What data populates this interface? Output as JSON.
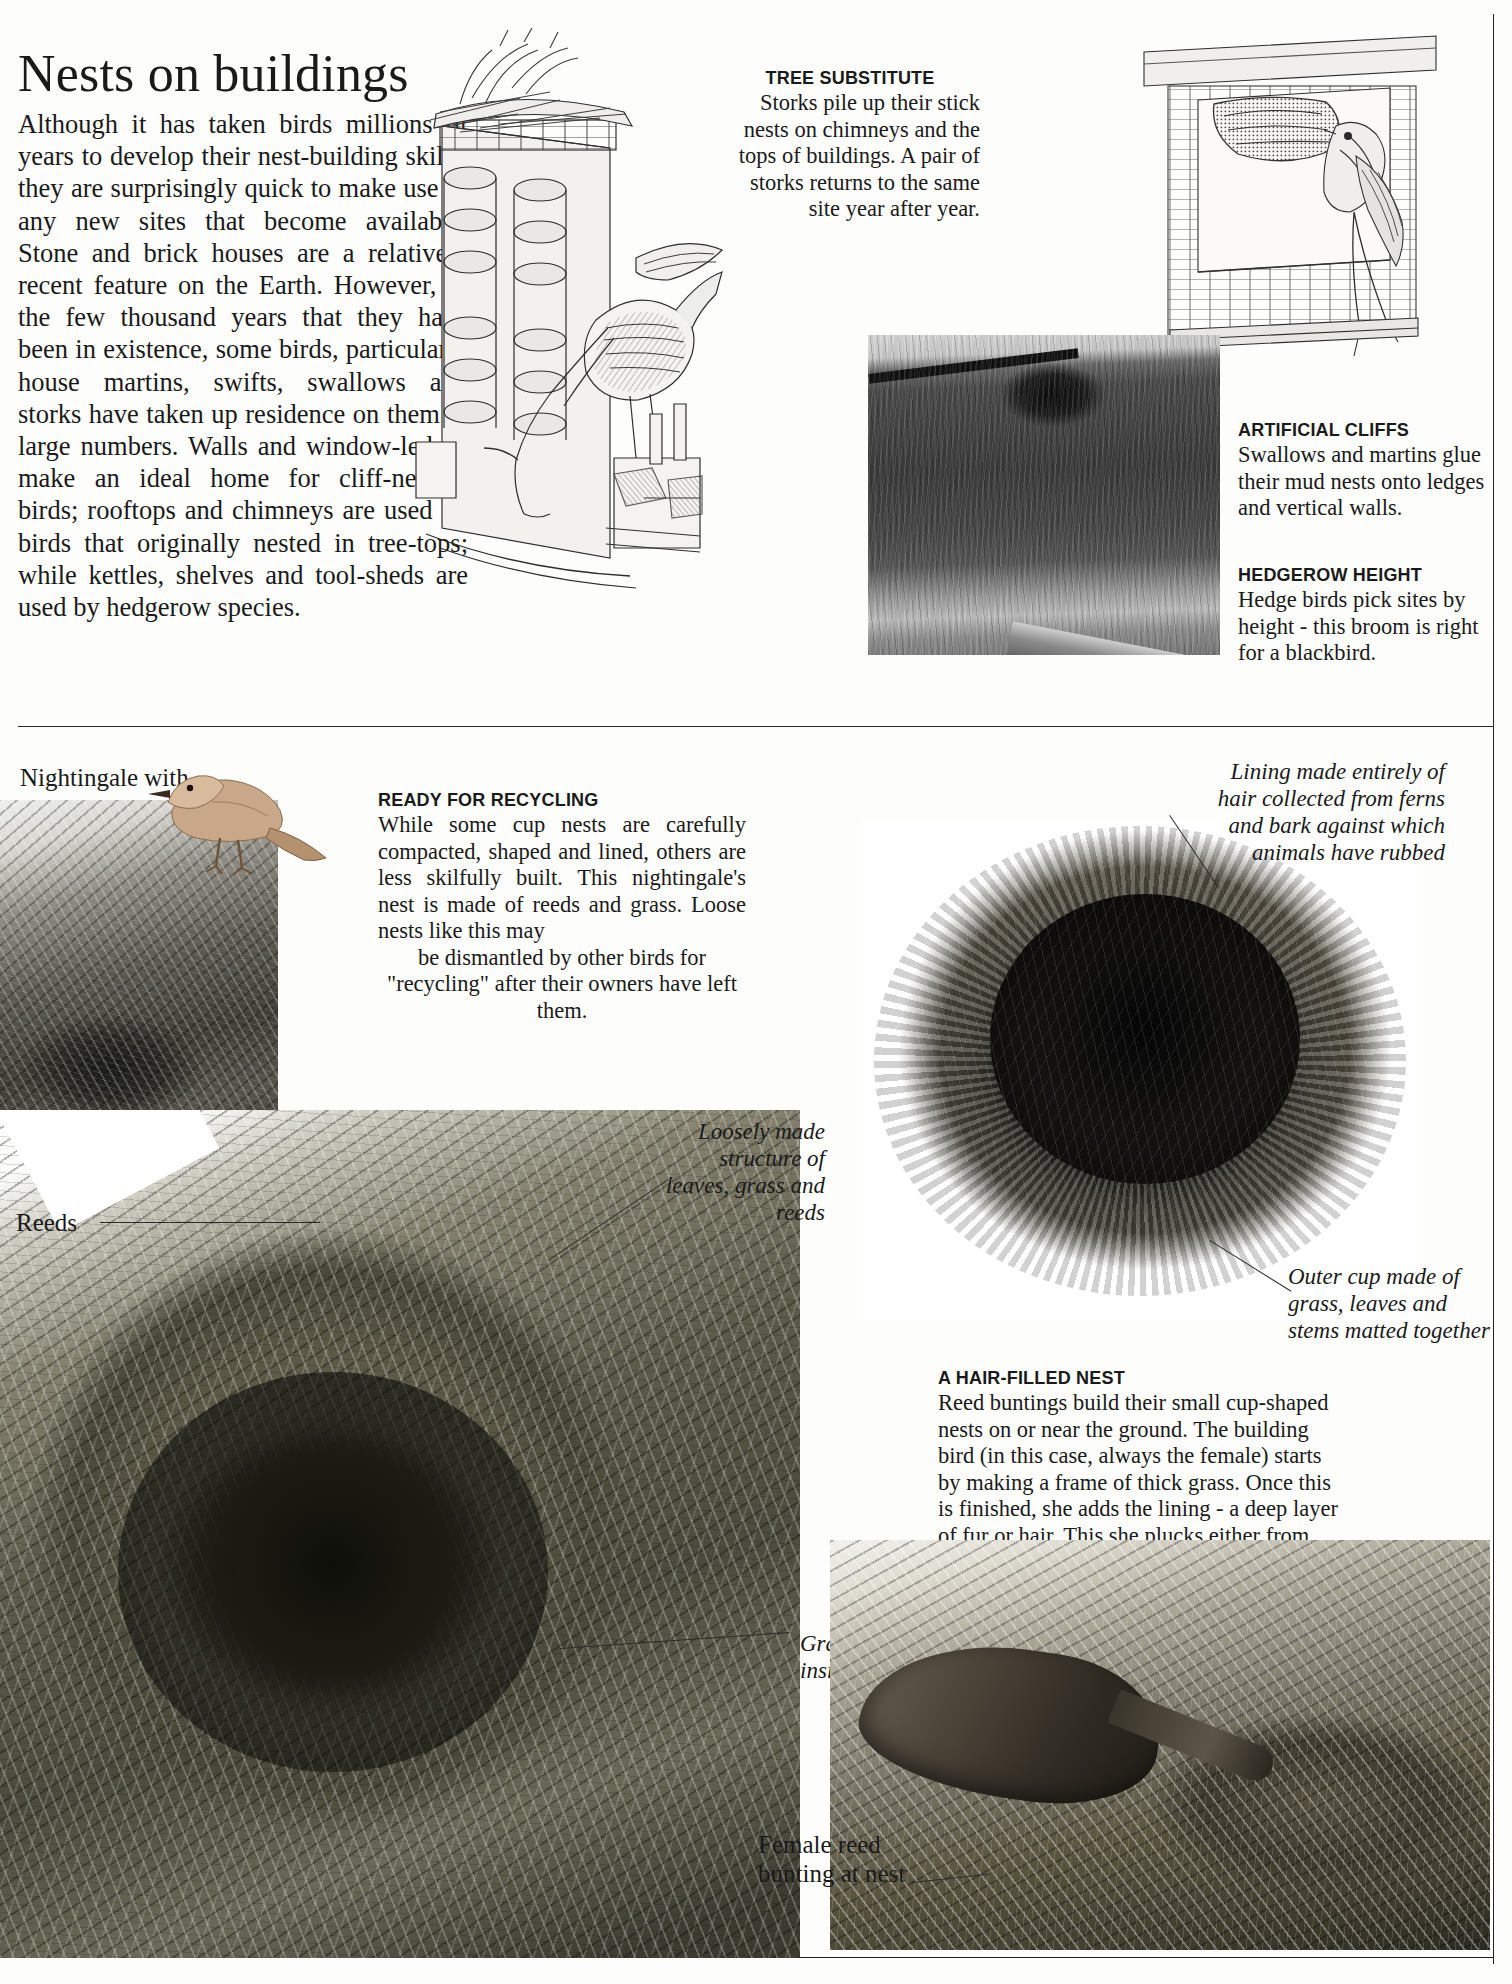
{
  "page": {
    "title": "Nests on buildings",
    "intro": "Although it has taken birds millions of years to develop their nest-building skills, they are surprisingly quick to make use of any new sites that become available. Stone and brick houses are a relatively recent feature on the Earth. However, in the few thousand years that they have been in existence, some birds, particularly house martins, swifts, swallows and storks have taken up residence on them in large numbers. Walls and window-ledges make an ideal home for cliff-nesting birds; rooftops and chimneys are used by birds that originally nested in tree-tops; while kettles, shelves and tool-sheds are used by hedgerow species."
  },
  "captions": {
    "tree_substitute": {
      "heading": "TREE SUBSTITUTE",
      "body": "Storks pile up their stick nests on chimneys and the tops of buildings. A pair of storks returns to the same site year after year."
    },
    "artificial_cliffs": {
      "heading": "ARTIFICIAL CLIFFS",
      "body": "Swallows and martins glue their mud nests onto ledges and vertical walls."
    },
    "hedgerow_height": {
      "heading": "HEDGEROW HEIGHT",
      "body": "Hedge birds pick sites by height - this broom is right for a blackbird."
    },
    "ready_for_recycling": {
      "heading": "READY FOR RECYCLING",
      "body": "While some cup nests are carefully compacted, shaped and lined, others are less skilfully built. This nightingale's nest is made of reeds and grass. Loose nests like this may",
      "body_tail": "be dismantled by other birds for \"recycling\" after their owners have left them."
    },
    "hair_filled_nest": {
      "heading": "A HAIR-FILLED NEST",
      "body": "Reed buntings build their small cup-shaped nests on or near the ground. The building bird (in this case, always the female) starts by making a frame of thick grass. Once this is finished, she adds the lining - a deep layer of fur or hair. This she plucks either from the thorns of hedgerow shrubs or from the barbs of barbed wire."
    }
  },
  "annotations": {
    "lining_hair": "Lining made entirely of hair collected from ferns and bark against which animals have rubbed",
    "outer_cup": "Outer cup made of grass, leaves and stems matted together",
    "loosely_made": "Loosely made structure of leaves, grass and reeds",
    "grass_lining": "Grass lining on inside of cup"
  },
  "labels": {
    "nightingale": "Nightingale with young",
    "reeds": "Reeds",
    "female_bunting": "Female reed bunting at nest"
  },
  "figures": {
    "stork": "stork-nest-on-chimney-engraving",
    "eaves": "swallow-at-mud-nest-under-eaves-engraving",
    "broom": "blackbird-nest-in-broom-photo",
    "nightingale_nest": "nightingale-nest-photo",
    "big_nest": "loose-reed-and-leaf-nest-photo",
    "bunting_nest": "reed-bunting-cup-nest-photo",
    "bunting_at_nest": "female-reed-bunting-at-nest-photo"
  }
}
